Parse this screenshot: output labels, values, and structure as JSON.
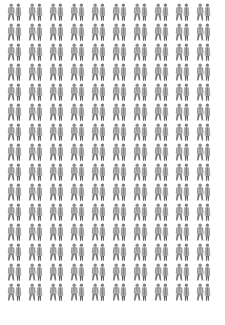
{
  "pattern": {
    "description": "Tiled grid of paired standing figures",
    "columns": 10,
    "rows": 15,
    "tile_icon": "pair-of-people-icon",
    "colors": {
      "background": "#ffffff",
      "figure_dark": "#6a6a6a",
      "figure_mid": "#9a9a9a",
      "figure_light": "#c4c4c4"
    }
  }
}
